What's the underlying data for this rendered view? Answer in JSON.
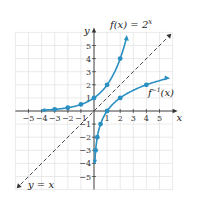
{
  "chart_data": {
    "type": "line",
    "title": "",
    "xlabel": "x",
    "ylabel": "y",
    "xlim": [
      -6,
      6
    ],
    "ylim": [
      -6,
      6
    ],
    "grid": true,
    "x_ticks": [
      -5,
      -4,
      -3,
      -2,
      -1,
      1,
      2,
      3,
      4,
      5
    ],
    "y_ticks": [
      5,
      4,
      3,
      2,
      1,
      -1,
      -2,
      -3,
      -4,
      -5
    ],
    "series": [
      {
        "name": "f(x) = 2^x",
        "label": "f(x) = 2",
        "label_sup": "x",
        "color": "#2a8fc1",
        "style": "solid",
        "points": [
          [
            -3,
            0.125
          ],
          [
            -2,
            0.25
          ],
          [
            -1,
            0.5
          ],
          [
            0,
            1
          ],
          [
            1,
            2
          ],
          [
            2,
            4
          ]
        ]
      },
      {
        "name": "f^-1(x)",
        "label": "f",
        "label_sup": "−1",
        "label_tail": "(x)",
        "color": "#2a8fc1",
        "style": "solid",
        "points": [
          [
            0.125,
            -3
          ],
          [
            0.25,
            -2
          ],
          [
            0.5,
            -1
          ],
          [
            1,
            0
          ],
          [
            2,
            1
          ],
          [
            4,
            2
          ]
        ]
      },
      {
        "name": "y = x",
        "label": "y = x",
        "color": "#333333",
        "style": "dashed",
        "points": [
          [
            -6,
            -6
          ],
          [
            6,
            6
          ]
        ]
      }
    ]
  },
  "axes": {
    "x_label": "x",
    "y_label": "y"
  }
}
